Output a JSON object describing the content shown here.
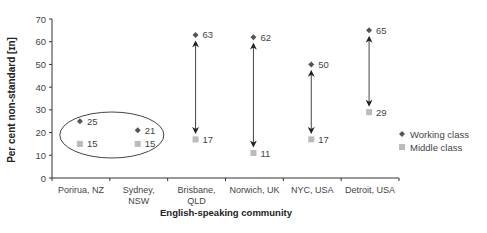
{
  "chart_data": {
    "type": "scatter",
    "title": "",
    "xlabel": "English-speaking community",
    "ylabel": "Per cent non-standard [ɪn]",
    "ylim": [
      0,
      70
    ],
    "yticks": [
      0,
      10,
      20,
      30,
      40,
      50,
      60,
      70
    ],
    "grid": false,
    "legend_position": "right",
    "categories": [
      [
        "Porirua, NZ"
      ],
      [
        "Sydney,",
        "NSW"
      ],
      [
        "Brisbane,",
        "QLD"
      ],
      [
        "Norwich, UK"
      ],
      [
        "NYC, USA"
      ],
      [
        "Detroit, USA"
      ]
    ],
    "series": [
      {
        "name": "Working class",
        "marker": "diamond",
        "color": "#555555",
        "values": [
          25,
          21,
          63,
          62,
          50,
          65
        ]
      },
      {
        "name": "Middle class",
        "marker": "square",
        "color": "#bbbbbb",
        "values": [
          15,
          15,
          17,
          11,
          17,
          29
        ]
      }
    ],
    "annotations": {
      "double_arrows_between_series_for_categories": [
        2,
        3,
        4,
        5
      ],
      "ellipse_around_categories": [
        0,
        1
      ]
    }
  }
}
